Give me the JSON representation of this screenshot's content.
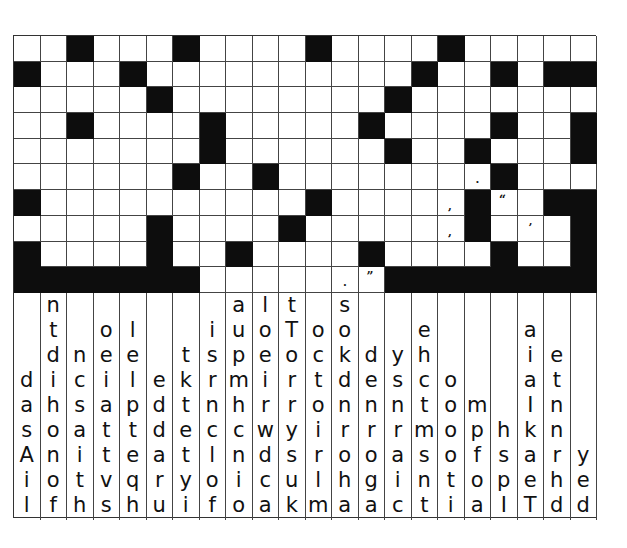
{
  "puzzle": {
    "type": "drop-quote",
    "columns": 22,
    "rows": 10,
    "grid": [
      "..#...#....#....#.....",
      "#...#..........#..#.##",
      ".....#........#.......",
      "..#....#.....#....#..#",
      ".......#......#..#...#",
      "......#..#.......P#...",
      "#..........#....C#O.##",
      ".....#....#.....C#.A.#",
      "#....#..#....#....#..#",
      "#######.....PQ########"
    ],
    "legend": {
      ".": "white",
      "#": "black",
      "C": "comma",
      "P": "period",
      "O": "open-quote",
      "Q": "close-quote",
      "A": "apostrophe"
    },
    "punctuation_glyphs": {
      "comma": ",",
      "period": ".",
      "open-quote": "“",
      "close-quote": "”",
      "apostrophe": "’"
    },
    "colors": {
      "black_cell": "#0d0d0d",
      "white_cell": "#ffffff",
      "grid_line": "#444444",
      "letter": "#111111"
    }
  },
  "letter_columns": [
    [
      "d",
      "a",
      "s",
      "A",
      "i",
      "l"
    ],
    [
      "n",
      "t",
      "d",
      "i",
      "h",
      "o",
      "n",
      "o",
      "f"
    ],
    [
      "n",
      "c",
      "s",
      "a",
      "i",
      "t",
      "h"
    ],
    [
      "o",
      "e",
      "i",
      "a",
      "t",
      "t",
      "v",
      "s"
    ],
    [
      "l",
      "e",
      "l",
      "p",
      "t",
      "e",
      "q",
      "h"
    ],
    [
      "e",
      "d",
      "d",
      "a",
      "r",
      "u"
    ],
    [
      "t",
      "k",
      "t",
      "e",
      "t",
      "y",
      "i"
    ],
    [
      "i",
      "s",
      "r",
      "n",
      "c",
      "l",
      "o",
      "f"
    ],
    [
      "a",
      "u",
      "p",
      "m",
      "h",
      "c",
      "n",
      "i",
      "o"
    ],
    [
      "l",
      "o",
      "e",
      "i",
      "r",
      "w",
      "d",
      "c",
      "a"
    ],
    [
      "t",
      "T",
      "o",
      "r",
      "r",
      "y",
      "s",
      "u",
      "k"
    ],
    [
      "o",
      "c",
      "t",
      "o",
      "i",
      "r",
      "l",
      "m"
    ],
    [
      "s",
      "o",
      "k",
      "d",
      "n",
      "r",
      "o",
      "h",
      "a"
    ],
    [
      "d",
      "e",
      "n",
      "r",
      "o",
      "g",
      "a"
    ],
    [
      "y",
      "s",
      "n",
      "r",
      "a",
      "i",
      "c"
    ],
    [
      "e",
      "h",
      "c",
      "t",
      "m",
      "s",
      "n",
      "t"
    ],
    [
      "o",
      "o",
      "o",
      "o",
      "t",
      "i"
    ],
    [
      "m",
      "p",
      "f",
      "o",
      "a"
    ],
    [
      "h",
      "s",
      "p",
      "I"
    ],
    [
      "a",
      "i",
      "a",
      "I",
      "k",
      "a",
      "e",
      "T"
    ],
    [
      "e",
      "t",
      "n",
      "n",
      "r",
      "h",
      "d"
    ],
    [
      "y",
      "e",
      "d"
    ]
  ]
}
